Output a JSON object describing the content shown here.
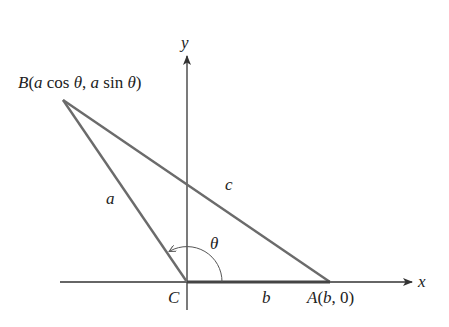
{
  "diagram": {
    "type": "triangle-on-coordinate-axes",
    "axes": {
      "x_label": "x",
      "y_label": "y"
    },
    "vertices": {
      "B": {
        "label": "B(a cos θ, a sin θ)",
        "name": "B"
      },
      "C": {
        "label": "C",
        "name": "C"
      },
      "A": {
        "label": "A(b, 0)",
        "name": "A"
      }
    },
    "sides": {
      "a": "a",
      "b": "b",
      "c": "c"
    },
    "angle": {
      "label": "θ"
    },
    "colors": {
      "triangle_stroke": "#6b6b6b",
      "axis_stroke": "#333333",
      "text": "#222222"
    }
  }
}
